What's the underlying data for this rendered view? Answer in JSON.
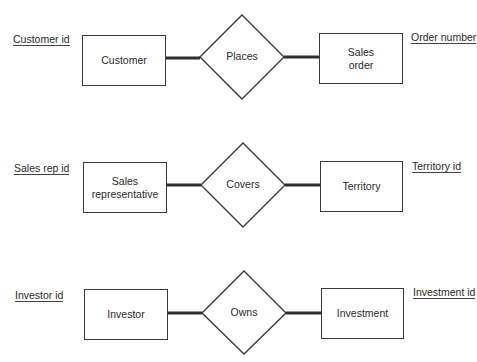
{
  "diagram": {
    "type": "entity-relationship",
    "colors": {
      "stroke": "#3a3a3a",
      "text": "#2a2a2a",
      "background": "#ffffff"
    },
    "rows": [
      {
        "left_entity": {
          "label": "Customer",
          "key_attribute": "Customer id"
        },
        "relationship": {
          "label": "Places"
        },
        "right_entity": {
          "label_line1": "Sales",
          "label_line2": "order",
          "key_attribute": "Order number"
        }
      },
      {
        "left_entity": {
          "label_line1": "Sales",
          "label_line2": "representative",
          "key_attribute": "Sales rep id"
        },
        "relationship": {
          "label": "Covers"
        },
        "right_entity": {
          "label": "Territory",
          "key_attribute": "Territory id"
        }
      },
      {
        "left_entity": {
          "label": "Investor",
          "key_attribute": "Investor id"
        },
        "relationship": {
          "label": "Owns"
        },
        "right_entity": {
          "label": "Investment",
          "key_attribute": "Investment id"
        }
      }
    ]
  }
}
